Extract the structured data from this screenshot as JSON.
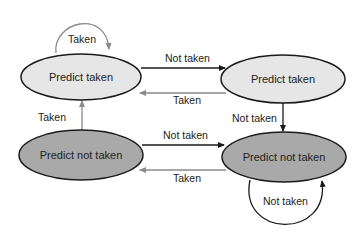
{
  "diagram": {
    "type": "state-machine",
    "colors": {
      "light_state": "#e6e6e6",
      "dark_state": "#a9a9a9",
      "outline": "#1a1a1a",
      "black_arrow": "#1a1a1a",
      "gray_arrow": "#8a8a8a"
    },
    "states": [
      {
        "id": "s_tl",
        "label": "Predict taken",
        "shade": "light"
      },
      {
        "id": "s_tr",
        "label": "Predict taken",
        "shade": "light"
      },
      {
        "id": "s_bl",
        "label": "Predict not taken",
        "shade": "dark"
      },
      {
        "id": "s_br",
        "label": "Predict not taken",
        "shade": "dark"
      }
    ],
    "transitions": [
      {
        "from": "s_tl",
        "to": "s_tl",
        "label": "Taken"
      },
      {
        "from": "s_tl",
        "to": "s_tr",
        "label": "Not taken"
      },
      {
        "from": "s_tr",
        "to": "s_tl",
        "label": "Taken"
      },
      {
        "from": "s_tr",
        "to": "s_br",
        "label": "Not taken"
      },
      {
        "from": "s_bl",
        "to": "s_tl",
        "label": "Taken"
      },
      {
        "from": "s_bl",
        "to": "s_br",
        "label": "Not taken"
      },
      {
        "from": "s_br",
        "to": "s_bl",
        "label": "Taken"
      },
      {
        "from": "s_br",
        "to": "s_br",
        "label": "Not taken"
      }
    ]
  }
}
